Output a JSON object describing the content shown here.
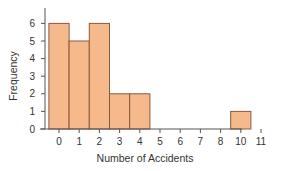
{
  "chart_data": {
    "type": "bar",
    "subtype": "histogram",
    "title": "",
    "xlabel": "Number of Accidents",
    "ylabel": "Frequency",
    "categories": [
      "0",
      "1",
      "2",
      "3",
      "4",
      "5",
      "6",
      "7",
      "8",
      "10",
      "11"
    ],
    "values": [
      6,
      5,
      6,
      2,
      2,
      0,
      0,
      0,
      0,
      1,
      0
    ],
    "ylim": [
      0,
      6
    ],
    "yticks": [
      0,
      1,
      2,
      3,
      4,
      5,
      6
    ],
    "xticks": [
      "0",
      "1",
      "2",
      "3",
      "4",
      "5",
      "6",
      "7",
      "8",
      "10",
      "11"
    ],
    "grid": false,
    "legend": null,
    "colors": {
      "bar_fill": "#f6b98c",
      "bar_edge": "#8a5a3c",
      "axis": "#555555"
    }
  },
  "labels": {
    "xlabel": "Number of Accidents",
    "ylabel": "Frequency"
  }
}
